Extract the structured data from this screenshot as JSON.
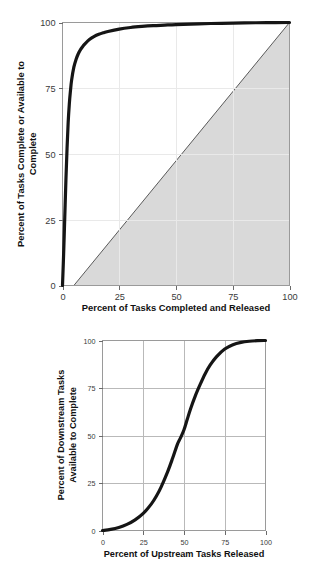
{
  "page": {
    "background_color": "#ffffff",
    "text_color": "#1a1a1a"
  },
  "figures": [
    {
      "id": "top",
      "xlabel": "Percent of Tasks Completed and Released",
      "ylabel_line1": "Percent of Tasks Complete or Available to",
      "ylabel_line2": "Complete",
      "xticks": [
        "0",
        "25",
        "50",
        "75",
        "100"
      ],
      "yticks": [
        "0",
        "25",
        "50",
        "75",
        "100"
      ]
    },
    {
      "id": "bottom",
      "xlabel": "Percent of Upstream Tasks Released",
      "ylabel_line1": "Percent of Downstream Tasks",
      "ylabel_line2": "Available to Complete",
      "xticks": [
        "0",
        "25",
        "50",
        "75",
        "100"
      ],
      "yticks": [
        "0",
        "25",
        "50",
        "75",
        "100"
      ]
    }
  ],
  "chart_data": [
    {
      "type": "line",
      "id": "top-chart",
      "title": "",
      "xlabel": "Percent of Tasks Completed and Released",
      "ylabel": "Percent of Tasks Complete or Available to Complete",
      "xlim": [
        0,
        100
      ],
      "ylim": [
        0,
        100
      ],
      "xticks": [
        0,
        25,
        50,
        75,
        100
      ],
      "yticks": [
        0,
        25,
        50,
        75,
        100
      ],
      "grid": true,
      "legend": "none",
      "curve_color": "#151515",
      "shaded_region_color": "#d9d9d9",
      "series": [
        {
          "name": "Tasks complete or available to complete",
          "x": [
            0,
            0.5,
            1,
            1.5,
            2,
            2.5,
            3,
            3.5,
            4,
            5,
            6,
            7,
            8,
            9,
            10,
            12,
            14,
            16,
            18,
            20,
            25,
            30,
            35,
            40,
            45,
            50,
            60,
            70,
            80,
            90,
            100
          ],
          "y": [
            0,
            12,
            26,
            40,
            52,
            62,
            69,
            74,
            78,
            83,
            86,
            88.2,
            89.8,
            91,
            92,
            93.6,
            94.7,
            95.5,
            96.1,
            96.6,
            97.5,
            98.1,
            98.5,
            98.8,
            99.0,
            99.2,
            99.5,
            99.7,
            99.85,
            99.95,
            100
          ]
        }
      ],
      "annotations": [
        {
          "name": "shaded-triangle",
          "description": "Light gray filled triangle bounded by the 45-degree diagonal, the x-axis, and the right frame edge",
          "vertices": [
            [
              5,
              0
            ],
            [
              100,
              0
            ],
            [
              100,
              100
            ]
          ],
          "fill": "#d9d9d9",
          "edge": "#4a4a4a"
        }
      ]
    },
    {
      "type": "line",
      "id": "bottom-chart",
      "title": "",
      "xlabel": "Percent of Upstream Tasks Released",
      "ylabel": "Percent of Downstream Tasks Available to Complete",
      "xlim": [
        0,
        100
      ],
      "ylim": [
        0,
        100
      ],
      "xticks": [
        0,
        25,
        50,
        75,
        100
      ],
      "yticks": [
        0,
        25,
        50,
        75,
        100
      ],
      "grid": true,
      "legend": "none",
      "curve_color": "#151515",
      "series": [
        {
          "name": "Downstream tasks available to complete",
          "x": [
            0,
            5,
            10,
            15,
            20,
            25,
            30,
            33,
            36,
            40,
            43,
            46,
            48,
            50,
            52,
            54,
            57,
            60,
            63,
            66,
            70,
            75,
            80,
            85,
            90,
            95,
            100
          ],
          "y": [
            0,
            0.6,
            1.6,
            3.2,
            5.6,
            9.0,
            14.0,
            18.0,
            23.0,
            31.0,
            38.0,
            45.5,
            49.0,
            53.0,
            58.5,
            64.0,
            71.0,
            77.0,
            82.5,
            87.0,
            91.5,
            95.5,
            97.8,
            99.0,
            99.6,
            99.9,
            100
          ]
        }
      ]
    }
  ]
}
